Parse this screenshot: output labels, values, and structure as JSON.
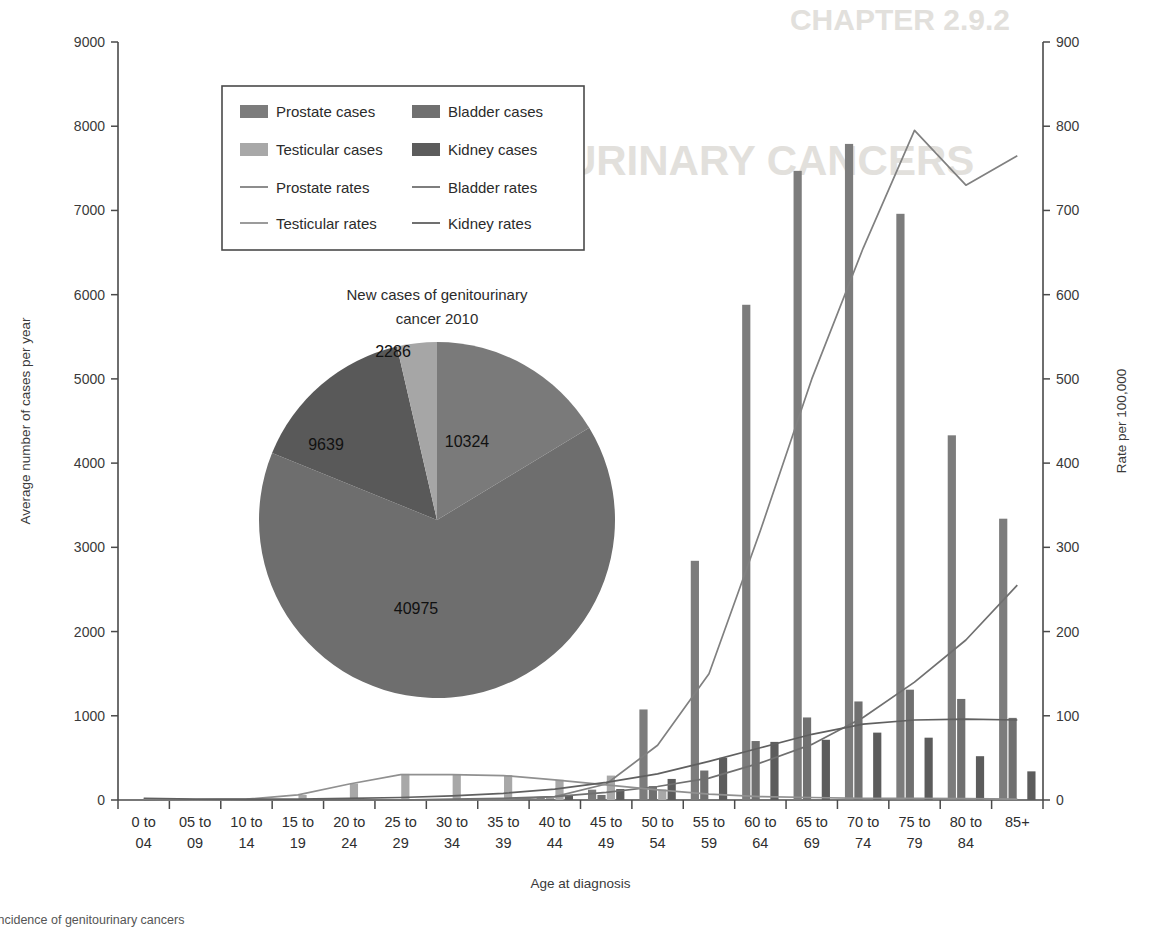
{
  "figure": {
    "caption": "Incidence of genitourinary cancers",
    "background_text_top": "CHAPTER 2.9.2",
    "background_text_mid": "GENITOURINARY CANCERS"
  },
  "axes": {
    "y_left_title": "Average number of cases per year",
    "y_right_title": "Rate per 100,000",
    "x_title": "Age at diagnosis",
    "y_left_ticks": [
      "0",
      "1000",
      "2000",
      "3000",
      "4000",
      "5000",
      "6000",
      "7000",
      "8000",
      "9000"
    ],
    "y_right_ticks": [
      "0",
      "100",
      "200",
      "300",
      "400",
      "500",
      "600",
      "700",
      "800",
      "900"
    ],
    "y_left_min": 0,
    "y_left_max": 9000,
    "y_right_min": 0,
    "y_right_max": 900
  },
  "legend": {
    "items": [
      {
        "label": "Prostate cases",
        "type": "swatch",
        "color": "#7c7c7c"
      },
      {
        "label": "Bladder cases",
        "type": "swatch",
        "color": "#707070"
      },
      {
        "label": "Testicular cases",
        "type": "swatch",
        "color": "#a8a8a8"
      },
      {
        "label": "Kidney cases",
        "type": "swatch",
        "color": "#5c5c5c"
      },
      {
        "label": "Prostate rates",
        "type": "line",
        "color": "#808080"
      },
      {
        "label": "Bladder rates",
        "type": "line",
        "color": "#707070"
      },
      {
        "label": "Testicular rates",
        "type": "line",
        "color": "#909090"
      },
      {
        "label": "Kidney rates",
        "type": "line",
        "color": "#606060"
      }
    ]
  },
  "pie": {
    "title_line1": "New cases of genitourinary",
    "title_line2": "cancer 2010",
    "labels": [
      "2286",
      "10324",
      "40975",
      "9639"
    ]
  },
  "chart_data": {
    "type": "bar",
    "title": "Incidence of genitourinary cancers",
    "xlabel": "Age at diagnosis",
    "ylabel": "Average number of cases per year",
    "y2label": "Rate per 100,000",
    "ylim": [
      0,
      9000
    ],
    "y2lim": [
      0,
      900
    ],
    "grid": false,
    "legend_position": "upper-left",
    "categories": [
      "0 to 04",
      "05 to 09",
      "10 to 14",
      "15 to 19",
      "20 to 24",
      "25 to 29",
      "30 to 34",
      "35 to 39",
      "40 to 44",
      "45 to 49",
      "50 to 54",
      "55 to 59",
      "60 to 64",
      "65 to 69",
      "70 to 74",
      "75 to 79",
      "80 to 84",
      "85+"
    ],
    "series": [
      {
        "name": "Prostate cases",
        "axis": "left",
        "kind": "bar",
        "color": "#7c7c7c",
        "values": [
          0,
          0,
          0,
          0,
          0,
          0,
          0,
          3,
          28,
          123,
          1075,
          2840,
          5880,
          7470,
          7790,
          6960,
          4330,
          3340
        ]
      },
      {
        "name": "Bladder cases",
        "axis": "left",
        "kind": "bar",
        "color": "#707070",
        "values": [
          0,
          0,
          0,
          0,
          0,
          0,
          0,
          0,
          20,
          60,
          165,
          350,
          700,
          980,
          1170,
          1310,
          1200,
          975
        ]
      },
      {
        "name": "Testicular cases",
        "axis": "left",
        "kind": "bar",
        "color": "#a8a8a8",
        "values": [
          18,
          0,
          0,
          60,
          195,
          310,
          300,
          295,
          240,
          290,
          125,
          0,
          0,
          0,
          0,
          0,
          0,
          0
        ]
      },
      {
        "name": "Kidney cases",
        "axis": "left",
        "kind": "bar",
        "color": "#5c5c5c",
        "values": [
          20,
          0,
          0,
          0,
          0,
          0,
          0,
          0,
          55,
          130,
          250,
          500,
          690,
          715,
          800,
          740,
          520,
          340
        ]
      },
      {
        "name": "Prostate rates",
        "axis": "right",
        "kind": "line",
        "color": "#808080",
        "values": [
          0,
          0,
          0,
          0,
          0,
          0,
          0,
          0.5,
          4,
          19,
          65,
          150,
          320,
          500,
          655,
          795,
          730,
          765
        ]
      },
      {
        "name": "Bladder rates",
        "axis": "right",
        "kind": "line",
        "color": "#707070",
        "values": [
          0,
          0,
          0,
          0,
          0,
          0,
          1,
          2,
          4,
          9,
          16,
          26,
          44,
          66,
          98,
          140,
          190,
          255
        ]
      },
      {
        "name": "Testicular rates",
        "axis": "right",
        "kind": "line",
        "color": "#909090",
        "values": [
          1,
          0.5,
          1,
          6,
          19,
          30,
          30,
          29,
          24,
          18,
          12,
          7,
          4,
          3,
          2,
          2,
          1.5,
          1
        ]
      },
      {
        "name": "Kidney rates",
        "axis": "right",
        "kind": "line",
        "color": "#606060",
        "values": [
          2,
          1,
          1,
          1,
          2,
          3,
          5,
          8,
          13,
          21,
          31,
          46,
          62,
          78,
          90,
          95,
          96,
          95
        ]
      }
    ],
    "pie": {
      "type": "pie",
      "title": "New cases of genitourinary cancer 2010",
      "slices": [
        {
          "label": "Prostate",
          "value": 40975,
          "color": "#6e6e6e"
        },
        {
          "label": "Bladder",
          "value": 10324,
          "color": "#7a7a7a"
        },
        {
          "label": "Kidney",
          "value": 9639,
          "color": "#595959"
        },
        {
          "label": "Testicular",
          "value": 2286,
          "color": "#a6a6a6"
        }
      ]
    }
  }
}
